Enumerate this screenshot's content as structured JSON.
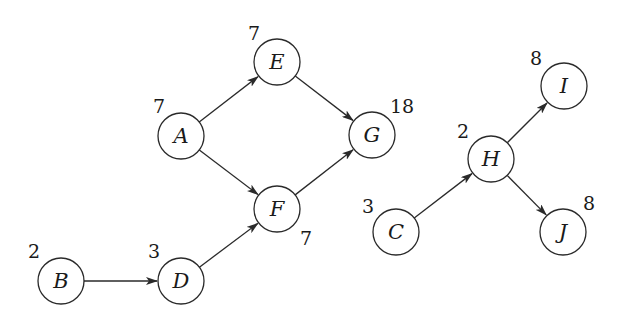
{
  "diagram": {
    "type": "directed-graph",
    "node_radius": 23,
    "colors": {
      "stroke": "#2a2a2a",
      "text": "#1a1a1a",
      "background": "#ffffff"
    },
    "nodes": [
      {
        "id": "A",
        "label": "A",
        "weight": "7",
        "x": 181,
        "y": 136,
        "wx": 153,
        "wy": 113
      },
      {
        "id": "E",
        "label": "E",
        "weight": "7",
        "x": 277,
        "y": 62,
        "wx": 248,
        "wy": 40
      },
      {
        "id": "G",
        "label": "G",
        "weight": "18",
        "x": 372,
        "y": 135,
        "wx": 390,
        "wy": 113
      },
      {
        "id": "F",
        "label": "F",
        "weight": "7",
        "x": 277,
        "y": 209,
        "wx": 300,
        "wy": 245
      },
      {
        "id": "B",
        "label": "B",
        "weight": "2",
        "x": 61,
        "y": 281,
        "wx": 28,
        "wy": 258
      },
      {
        "id": "D",
        "label": "D",
        "weight": "3",
        "x": 181,
        "y": 281,
        "wx": 148,
        "wy": 258
      },
      {
        "id": "C",
        "label": "C",
        "weight": "3",
        "x": 396,
        "y": 232,
        "wx": 362,
        "wy": 213
      },
      {
        "id": "H",
        "label": "H",
        "weight": "2",
        "x": 491,
        "y": 159,
        "wx": 457,
        "wy": 138
      },
      {
        "id": "I",
        "label": "I",
        "weight": "8",
        "x": 564,
        "y": 86,
        "wx": 530,
        "wy": 65
      },
      {
        "id": "J",
        "label": "J",
        "weight": "8",
        "x": 563,
        "y": 232,
        "wx": 583,
        "wy": 210
      }
    ],
    "edges": [
      {
        "from": "A",
        "to": "E"
      },
      {
        "from": "A",
        "to": "F"
      },
      {
        "from": "E",
        "to": "G"
      },
      {
        "from": "F",
        "to": "G"
      },
      {
        "from": "B",
        "to": "D"
      },
      {
        "from": "D",
        "to": "F"
      },
      {
        "from": "C",
        "to": "H"
      },
      {
        "from": "H",
        "to": "I"
      },
      {
        "from": "H",
        "to": "J"
      }
    ]
  }
}
